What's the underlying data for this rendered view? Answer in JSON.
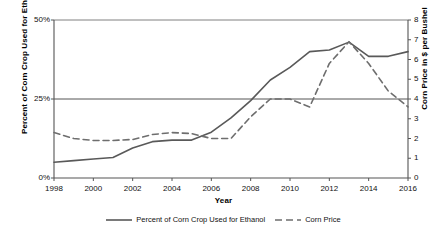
{
  "chart_data": {
    "type": "line",
    "title": "",
    "xlabel": "Year",
    "ylabel": "Percent of Corn Crop Used for Ethanol",
    "y2label": "Corn Price in $ per Bushel",
    "xlim": [
      1998,
      2016
    ],
    "ylim": [
      0,
      50
    ],
    "y2lim": [
      0,
      8
    ],
    "grid": "horizontal",
    "legend_position": "bottom",
    "x": [
      1998,
      1999,
      2000,
      2001,
      2002,
      2003,
      2004,
      2005,
      2006,
      2007,
      2008,
      2009,
      2010,
      2011,
      2012,
      2013,
      2014,
      2015,
      2016
    ],
    "xticks": [
      "1998",
      "2000",
      "2002",
      "2004",
      "2006",
      "2008",
      "2010",
      "2012",
      "2014",
      "2016"
    ],
    "yticks": [
      "0%",
      "25%",
      "50%"
    ],
    "y2ticks": [
      "0",
      "1",
      "2",
      "3",
      "4",
      "5",
      "6",
      "7",
      "8"
    ],
    "series": [
      {
        "name": "Percent of Corn Crop Used for Ethanol",
        "axis": "left",
        "style": "solid",
        "color": "#595959",
        "unit": "%",
        "values": [
          5.0,
          5.5,
          6.0,
          6.5,
          9.5,
          11.5,
          12.0,
          12.0,
          14.5,
          19.0,
          24.5,
          31.0,
          35.0,
          40.0,
          40.5,
          43.0,
          38.5,
          38.5,
          40.0
        ]
      },
      {
        "name": "Corn Price",
        "axis": "right",
        "style": "dashed",
        "color": "#6e6e6e",
        "unit": "$/bushel",
        "values": [
          2.3,
          2.0,
          1.9,
          1.9,
          1.95,
          2.2,
          2.3,
          2.25,
          2.0,
          2.0,
          3.1,
          4.0,
          4.0,
          3.6,
          5.8,
          6.9,
          5.8,
          4.4,
          3.6
        ]
      }
    ]
  },
  "legend": {
    "entries": [
      {
        "label": "Percent of Corn Crop Used for Ethanol",
        "style": "solid"
      },
      {
        "label": "Corn Price",
        "style": "dashed"
      }
    ]
  }
}
